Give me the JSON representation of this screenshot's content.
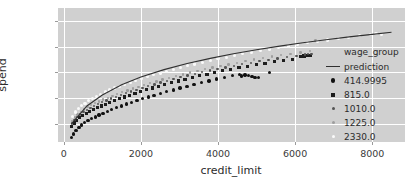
{
  "chart_data": {
    "type": "scatter",
    "title": "",
    "xlabel": "credit_limit",
    "ylabel": "spend",
    "xlim": [
      -150,
      8850
    ],
    "ylim": [
      1280,
      6520
    ],
    "xticks": [
      0,
      2000,
      4000,
      6000,
      8000
    ],
    "yticks": [
      2000,
      3000,
      4000,
      5000,
      6000
    ],
    "grid": true,
    "legend_position": "right-outside",
    "legend_title": "wage_group",
    "background": "#d0d0d0",
    "gridline_color": "#ffffff",
    "series": [
      {
        "name": "prediction",
        "kind": "line",
        "color": "#303030",
        "x": [
          200,
          600,
          1000,
          1500,
          2000,
          2600,
          3200,
          3800,
          4400,
          5000,
          5600,
          6200,
          6800,
          7400,
          8000,
          8500
        ],
        "values": [
          1990,
          2690,
          3120,
          3520,
          3820,
          4110,
          4350,
          4550,
          4730,
          4890,
          5030,
          5160,
          5280,
          5390,
          5490,
          5570
        ]
      },
      {
        "name": "414.9995",
        "kind": "scatter",
        "color": "#111111",
        "marker": "o",
        "x": [
          195,
          255,
          320,
          390,
          465,
          545,
          630,
          720,
          815,
          915,
          1020,
          1130,
          1245,
          1365,
          1490,
          1620,
          1755,
          1895,
          2040,
          2190,
          2345,
          2505,
          2670,
          2840,
          3015,
          3195,
          3380,
          3570,
          3765,
          3965,
          4170,
          4380,
          4560,
          4610,
          4700,
          4790,
          4880,
          4960,
          5050,
          5340
        ],
        "values": [
          1450,
          1600,
          1730,
          1850,
          1950,
          2040,
          2120,
          2190,
          2260,
          2330,
          2400,
          2470,
          2545,
          2620,
          2690,
          2760,
          2830,
          2900,
          2970,
          3040,
          3110,
          3180,
          3250,
          3320,
          3390,
          3460,
          3530,
          3600,
          3670,
          3740,
          3810,
          3880,
          3930,
          3860,
          3900,
          3870,
          3830,
          3810,
          3800,
          4000
        ]
      },
      {
        "name": "815.0",
        "kind": "scatter",
        "color": "#1d1d1d",
        "marker": "s",
        "x": [
          205,
          270,
          340,
          415,
          495,
          580,
          670,
          765,
          865,
          970,
          1080,
          1195,
          1315,
          1440,
          1570,
          1705,
          1845,
          1990,
          2140,
          2295,
          2455,
          2620,
          2790,
          2965,
          3145,
          3330,
          3520,
          3715,
          3915,
          4120,
          4330,
          4545,
          4765,
          4990,
          5220,
          5455,
          5695,
          5940,
          6140,
          6230,
          6310,
          6400
        ],
        "values": [
          1900,
          2020,
          2130,
          2230,
          2320,
          2400,
          2480,
          2550,
          2620,
          2690,
          2760,
          2830,
          2900,
          2970,
          3040,
          3110,
          3180,
          3250,
          3320,
          3390,
          3460,
          3530,
          3600,
          3665,
          3730,
          3800,
          3865,
          3930,
          3995,
          4060,
          4120,
          4185,
          4245,
          4305,
          4365,
          4420,
          4470,
          4520,
          4620,
          4640,
          4660,
          4670
        ]
      },
      {
        "name": "1010.0",
        "kind": "scatter",
        "color": "#545454",
        "marker": ".",
        "x": [
          210,
          278,
          350,
          428,
          510,
          598,
          690,
          788,
          890,
          998,
          1110,
          1228,
          1350,
          1478,
          1610,
          1748,
          1890,
          2038,
          2190,
          2348,
          2510,
          2678,
          2850,
          3028,
          3210,
          3398,
          3590,
          3788,
          3990,
          4198,
          4410,
          4628,
          4850,
          5078,
          5310,
          5548,
          5790,
          6038,
          6250,
          6340,
          6430
        ],
        "values": [
          2010,
          2140,
          2255,
          2360,
          2455,
          2540,
          2620,
          2695,
          2765,
          2835,
          2905,
          2975,
          3045,
          3115,
          3185,
          3255,
          3325,
          3395,
          3465,
          3535,
          3605,
          3675,
          3742,
          3810,
          3876,
          3942,
          4008,
          4072,
          4136,
          4198,
          4260,
          4320,
          4380,
          4438,
          4495,
          4550,
          4600,
          4650,
          4700,
          4720,
          4730
        ]
      },
      {
        "name": "1225.0",
        "kind": "scatter",
        "color": "#9e9e9e",
        "marker": ".",
        "x": [
          215,
          285,
          360,
          440,
          525,
          615,
          710,
          810,
          915,
          1025,
          1140,
          1260,
          1385,
          1515,
          1650,
          1790,
          1935,
          2085,
          2240,
          2400,
          2565,
          2735,
          2910,
          3090,
          3275,
          3465,
          3660,
          3860,
          4065,
          4275,
          4490,
          4710,
          4935,
          5165,
          5400,
          5640,
          5885,
          6135,
          6390,
          6530
        ],
        "values": [
          2105,
          2240,
          2355,
          2460,
          2555,
          2640,
          2720,
          2795,
          2868,
          2940,
          3012,
          3084,
          3155,
          3226,
          3297,
          3368,
          3438,
          3508,
          3578,
          3648,
          3718,
          3788,
          3856,
          3924,
          3991,
          4058,
          4124,
          4189,
          4253,
          4316,
          4378,
          4439,
          4499,
          4558,
          4616,
          4672,
          4727,
          4780,
          4840,
          5250
        ]
      },
      {
        "name": "2330.0",
        "kind": "scatter",
        "color": "#fafafa",
        "marker": "o",
        "x": [
          220,
          295,
          375,
          460,
          550,
          645,
          745,
          850,
          960,
          1075,
          1195,
          1320,
          1450,
          1585,
          1725,
          1870,
          2020,
          2175,
          2335,
          2500,
          2670,
          2845,
          3025,
          3210,
          3400,
          3595,
          3795,
          4000,
          4210,
          4425,
          4645,
          4870,
          5100,
          5335,
          5575,
          5820,
          6070,
          6325,
          6585,
          6850,
          7120,
          7395,
          7675,
          7960,
          8100,
          8250
        ],
        "values": [
          2290,
          2450,
          2580,
          2695,
          2800,
          2895,
          2985,
          3070,
          3152,
          3232,
          3310,
          3388,
          3464,
          3540,
          3615,
          3690,
          3763,
          3836,
          3908,
          3980,
          4051,
          4122,
          4192,
          4261,
          4330,
          4398,
          4465,
          4532,
          4598,
          4663,
          4727,
          4790,
          4853,
          4915,
          4976,
          5036,
          5096,
          5155,
          5213,
          5270,
          5326,
          5382,
          5437,
          5491,
          5516,
          5470
        ]
      }
    ]
  },
  "legend": {
    "title": "wage_group",
    "entries": [
      {
        "label": "prediction",
        "marker": "line",
        "color": "#303030"
      },
      {
        "label": "414.9995",
        "marker": "circle",
        "color": "#111111"
      },
      {
        "label": "815.0",
        "marker": "square",
        "color": "#1d1d1d"
      },
      {
        "label": "1010.0",
        "marker": "dot",
        "color": "#545454"
      },
      {
        "label": "1225.0",
        "marker": "dot",
        "color": "#9e9e9e"
      },
      {
        "label": "2330.0",
        "marker": "dot",
        "color": "#fafafa"
      }
    ]
  }
}
